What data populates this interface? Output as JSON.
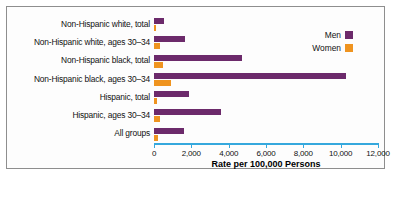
{
  "chart_data": {
    "type": "bar",
    "orientation": "horizontal",
    "title": "",
    "xlabel": "Rate per 100,000 Persons",
    "ylabel": "",
    "xlim": [
      0,
      12000
    ],
    "xticks": [
      "0",
      "2,000",
      "4,000",
      "6,000",
      "8,000",
      "10,000",
      "12,000"
    ],
    "xtick_values": [
      0,
      2000,
      4000,
      6000,
      8000,
      10000,
      12000
    ],
    "grid": false,
    "legend_position": "top-right",
    "categories": [
      "Non-Hispanic white, total",
      "Non-Hispanic white, ages 30–34",
      "Non-Hispanic black, total",
      "Non-Hispanic black, ages 30–34",
      "Hispanic, total",
      "Hispanic, ages 30–34",
      "All groups"
    ],
    "series": [
      {
        "name": "Men",
        "color": "#6c2a6b",
        "values": [
          560,
          1650,
          4700,
          10300,
          1900,
          3600,
          1600
        ]
      },
      {
        "name": "Women",
        "color": "#ef9420",
        "values": [
          120,
          330,
          480,
          900,
          180,
          330,
          200
        ]
      }
    ]
  },
  "legend": {
    "items": [
      {
        "label": "Men",
        "color": "#6c2a6b"
      },
      {
        "label": "Women",
        "color": "#ef9420"
      }
    ]
  },
  "axis": {
    "title": "Rate per 100,000 Persons",
    "line_color": "#35a8dd"
  },
  "caption": ""
}
